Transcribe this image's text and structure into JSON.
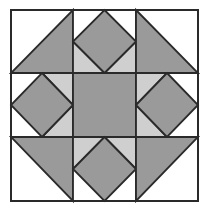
{
  "diagram": {
    "type": "quilt-block",
    "grid": {
      "rows": 3,
      "cols": 3
    },
    "bounds": {
      "x0": 11,
      "y0": 10,
      "x1": 198,
      "y1": 201
    },
    "lines": {
      "x": [
        11,
        73,
        136,
        198
      ],
      "y": [
        10,
        73,
        137,
        201
      ]
    },
    "colors": {
      "background": "#ffffff",
      "dark": "#9a9a9a",
      "light": "#cfcfcf",
      "stroke": "#2a2a2a"
    },
    "cells": [
      {
        "row": 0,
        "col": 0,
        "kind": "half-square-triangle",
        "dark_corner": "bottom-right"
      },
      {
        "row": 0,
        "col": 1,
        "kind": "square-in-square",
        "light_corners": [
          "bottom-left",
          "bottom-right"
        ]
      },
      {
        "row": 0,
        "col": 2,
        "kind": "half-square-triangle",
        "dark_corner": "bottom-left"
      },
      {
        "row": 1,
        "col": 0,
        "kind": "square-in-square",
        "light_corners": [
          "top-right",
          "bottom-right"
        ]
      },
      {
        "row": 1,
        "col": 1,
        "kind": "solid"
      },
      {
        "row": 1,
        "col": 2,
        "kind": "square-in-square",
        "light_corners": [
          "top-left",
          "bottom-left"
        ]
      },
      {
        "row": 2,
        "col": 0,
        "kind": "half-square-triangle",
        "dark_corner": "top-right"
      },
      {
        "row": 2,
        "col": 1,
        "kind": "square-in-square",
        "light_corners": [
          "top-left",
          "top-right"
        ]
      },
      {
        "row": 2,
        "col": 2,
        "kind": "half-square-triangle",
        "dark_corner": "top-left"
      }
    ]
  }
}
